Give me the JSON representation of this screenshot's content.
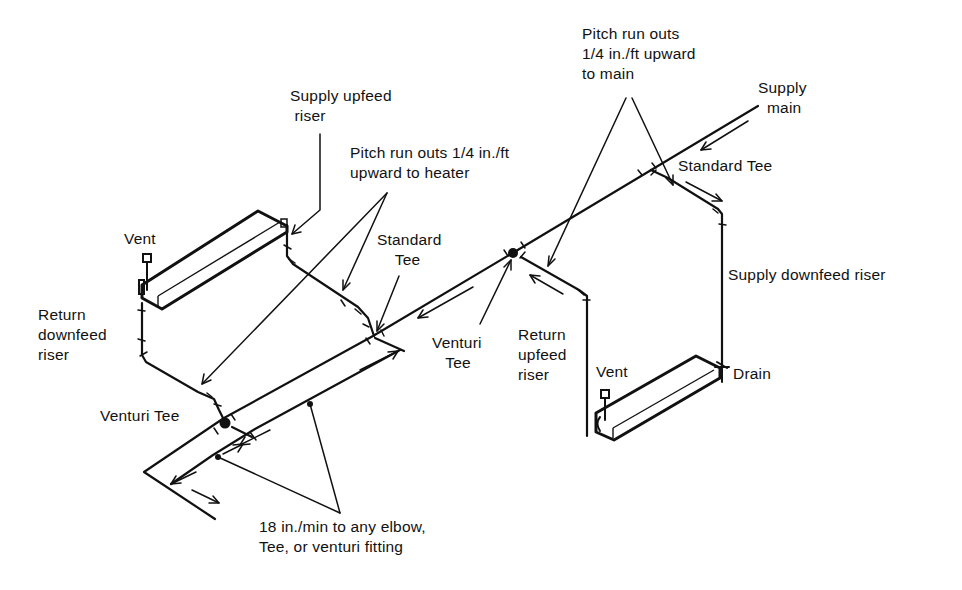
{
  "diagram": {
    "type": "isometric-piping-diagram",
    "labels": {
      "supply_upfeed_riser": "Supply upfeed\n riser",
      "pitch_heater": "Pitch run outs 1/4 in./ft\nupward to heater",
      "pitch_main": "Pitch run outs\n1/4 in./ft upward\nto main",
      "supply_main": "Supply\n  main",
      "standard_tee_right": "Standard Tee",
      "standard_tee_left": "Standard\n    Tee",
      "vent_left": "Vent",
      "vent_right": "Vent",
      "return_downfeed_riser": "Return\ndownfeed\nriser",
      "venturi_tee_left": "Venturi Tee",
      "venturi_tee_center": "Venturi\n   Tee",
      "return_upfeed_riser": "Return\nupfeed\nriser",
      "supply_downfeed_riser": "Supply downfeed riser",
      "drain": "Drain",
      "min_distance": "18 in./min to any elbow,\nTee, or venturi fitting"
    },
    "components": [
      {
        "name": "Supply main",
        "role": "pipe"
      },
      {
        "name": "Heater (left)",
        "role": "terminal unit",
        "fed_by": "Supply upfeed riser",
        "returns_via": "Return downfeed riser"
      },
      {
        "name": "Heater (right)",
        "role": "terminal unit",
        "fed_by": "Supply downfeed riser",
        "returns_via": "Return upfeed riser"
      },
      {
        "name": "Standard Tee",
        "count": 2
      },
      {
        "name": "Venturi Tee",
        "count": 2
      },
      {
        "name": "Vent",
        "count": 2
      },
      {
        "name": "Drain",
        "count": 1
      }
    ],
    "colors": {
      "line": "#111111",
      "background": "#ffffff"
    }
  }
}
